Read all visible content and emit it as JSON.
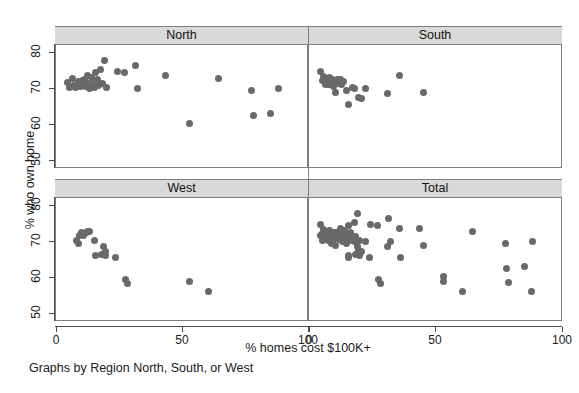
{
  "chart_data": {
    "type": "scatter",
    "title": "",
    "xlabel": "% homes cost $100K+",
    "ylabel": "% who own home",
    "caption": "Graphs by Region North, South, or West",
    "xlim": [
      0,
      100
    ],
    "ylim": [
      48,
      82
    ],
    "xticks": [
      0,
      50,
      100
    ],
    "yticks": [
      50,
      60,
      70,
      80
    ],
    "xtick_labels": [
      "0",
      "50",
      "100"
    ],
    "ytick_labels": [
      "50",
      "60",
      "70",
      "80"
    ],
    "grid": false,
    "legend": "none",
    "marker_color": "#696969",
    "strip_color": "#d9d9d9",
    "frame_color": "#7d7d7d",
    "panels": [
      {
        "label": "North",
        "row": 0,
        "col": 0,
        "points": [
          [
            4.6,
            71.4
          ],
          [
            5.4,
            70.2
          ],
          [
            6.6,
            72.6
          ],
          [
            7.2,
            70.6
          ],
          [
            8.0,
            70.0
          ],
          [
            9.3,
            71.7
          ],
          [
            10.0,
            70.4
          ],
          [
            10.6,
            72.1
          ],
          [
            11.0,
            71.0
          ],
          [
            11.6,
            72.4
          ],
          [
            12.1,
            70.3
          ],
          [
            12.6,
            73.4
          ],
          [
            13.0,
            71.3
          ],
          [
            13.4,
            69.9
          ],
          [
            14.2,
            72.8
          ],
          [
            14.8,
            71.1
          ],
          [
            15.4,
            70.2
          ],
          [
            16.0,
            74.2
          ],
          [
            16.6,
            72.3
          ],
          [
            17.1,
            70.6
          ],
          [
            18.0,
            75.1
          ],
          [
            18.6,
            71.2
          ],
          [
            19.4,
            77.6
          ],
          [
            20.2,
            70.2
          ],
          [
            24.6,
            74.5
          ],
          [
            27.4,
            74.2
          ],
          [
            31.8,
            76.1
          ],
          [
            32.4,
            69.8
          ],
          [
            43.8,
            73.4
          ],
          [
            53.2,
            60.3
          ],
          [
            64.8,
            72.7
          ],
          [
            77.8,
            69.2
          ],
          [
            78.4,
            62.3
          ],
          [
            85.4,
            62.9
          ],
          [
            88.6,
            69.7
          ]
        ]
      },
      {
        "label": "South",
        "row": 0,
        "col": 1,
        "points": [
          [
            4.8,
            74.4
          ],
          [
            5.6,
            72.0
          ],
          [
            6.0,
            73.2
          ],
          [
            6.6,
            71.0
          ],
          [
            7.2,
            72.5
          ],
          [
            7.8,
            70.9
          ],
          [
            8.4,
            73.0
          ],
          [
            8.8,
            71.6
          ],
          [
            9.4,
            72.2
          ],
          [
            9.9,
            70.5
          ],
          [
            10.4,
            71.9
          ],
          [
            10.8,
            68.6
          ],
          [
            11.4,
            72.3
          ],
          [
            12.0,
            71.2
          ],
          [
            12.6,
            72.4
          ],
          [
            13.2,
            70.9
          ],
          [
            14.0,
            71.7
          ],
          [
            15.2,
            69.4
          ],
          [
            16.0,
            65.3
          ],
          [
            17.4,
            70.2
          ],
          [
            18.0,
            69.7
          ],
          [
            19.6,
            67.4
          ],
          [
            20.8,
            67.2
          ],
          [
            22.4,
            69.7
          ],
          [
            31.2,
            68.5
          ],
          [
            36.0,
            73.4
          ],
          [
            45.6,
            68.8
          ]
        ]
      },
      {
        "label": "West",
        "row": 1,
        "col": 0,
        "points": [
          [
            8.4,
            70.2
          ],
          [
            9.0,
            69.2
          ],
          [
            9.6,
            71.4
          ],
          [
            10.4,
            72.2
          ],
          [
            11.2,
            71.6
          ],
          [
            12.2,
            72.4
          ],
          [
            12.8,
            72.6
          ],
          [
            13.6,
            72.5
          ],
          [
            15.6,
            70.1
          ],
          [
            16.0,
            65.9
          ],
          [
            18.4,
            66.2
          ],
          [
            19.2,
            68.4
          ],
          [
            19.8,
            67.0
          ],
          [
            20.0,
            65.9
          ],
          [
            24.0,
            65.4
          ],
          [
            27.6,
            59.4
          ],
          [
            28.4,
            58.3
          ],
          [
            53.2,
            58.8
          ],
          [
            60.8,
            56.1
          ]
        ]
      },
      {
        "label": "Total",
        "row": 1,
        "col": 1,
        "points": [
          [
            4.6,
            71.4
          ],
          [
            4.8,
            74.4
          ],
          [
            5.4,
            70.2
          ],
          [
            5.6,
            72.0
          ],
          [
            6.0,
            73.2
          ],
          [
            6.6,
            72.6
          ],
          [
            6.6,
            71.0
          ],
          [
            7.2,
            70.6
          ],
          [
            7.2,
            72.5
          ],
          [
            7.8,
            70.9
          ],
          [
            8.0,
            70.0
          ],
          [
            8.4,
            73.0
          ],
          [
            8.4,
            70.2
          ],
          [
            8.8,
            71.6
          ],
          [
            9.0,
            69.2
          ],
          [
            9.3,
            71.7
          ],
          [
            9.4,
            72.2
          ],
          [
            9.6,
            71.4
          ],
          [
            9.9,
            70.5
          ],
          [
            10.0,
            70.4
          ],
          [
            10.4,
            71.9
          ],
          [
            10.4,
            72.2
          ],
          [
            10.6,
            72.1
          ],
          [
            10.8,
            68.6
          ],
          [
            11.0,
            71.0
          ],
          [
            11.2,
            71.6
          ],
          [
            11.4,
            72.3
          ],
          [
            11.6,
            72.4
          ],
          [
            12.0,
            71.2
          ],
          [
            12.1,
            70.3
          ],
          [
            12.2,
            72.4
          ],
          [
            12.6,
            73.4
          ],
          [
            12.6,
            72.4
          ],
          [
            12.8,
            72.6
          ],
          [
            13.0,
            71.3
          ],
          [
            13.2,
            70.9
          ],
          [
            13.4,
            69.9
          ],
          [
            13.6,
            72.5
          ],
          [
            14.0,
            71.7
          ],
          [
            14.2,
            72.8
          ],
          [
            14.8,
            71.1
          ],
          [
            15.2,
            69.4
          ],
          [
            15.4,
            70.2
          ],
          [
            15.6,
            70.1
          ],
          [
            16.0,
            74.2
          ],
          [
            16.0,
            65.3
          ],
          [
            16.0,
            65.9
          ],
          [
            16.6,
            72.3
          ],
          [
            17.1,
            70.6
          ],
          [
            17.4,
            70.2
          ],
          [
            18.0,
            75.1
          ],
          [
            18.0,
            69.7
          ],
          [
            18.4,
            66.2
          ],
          [
            18.6,
            71.2
          ],
          [
            19.2,
            68.4
          ],
          [
            19.4,
            77.6
          ],
          [
            19.6,
            67.4
          ],
          [
            19.8,
            67.0
          ],
          [
            20.0,
            65.9
          ],
          [
            20.2,
            70.2
          ],
          [
            20.8,
            67.2
          ],
          [
            22.4,
            69.7
          ],
          [
            24.0,
            65.4
          ],
          [
            24.6,
            74.5
          ],
          [
            27.4,
            74.2
          ],
          [
            27.6,
            59.4
          ],
          [
            28.4,
            58.3
          ],
          [
            31.2,
            68.5
          ],
          [
            31.8,
            76.1
          ],
          [
            32.4,
            69.8
          ],
          [
            36.0,
            73.4
          ],
          [
            36.4,
            65.4
          ],
          [
            43.8,
            73.4
          ],
          [
            45.6,
            68.8
          ],
          [
            53.2,
            60.3
          ],
          [
            53.2,
            58.8
          ],
          [
            60.8,
            56.1
          ],
          [
            64.8,
            72.7
          ],
          [
            77.8,
            69.2
          ],
          [
            78.4,
            62.3
          ],
          [
            79.0,
            58.6
          ],
          [
            85.4,
            62.9
          ],
          [
            88.0,
            56.1
          ],
          [
            88.6,
            69.7
          ]
        ]
      }
    ]
  },
  "accessibility": {
    "figure_name": "scatter-plot-matrix"
  }
}
